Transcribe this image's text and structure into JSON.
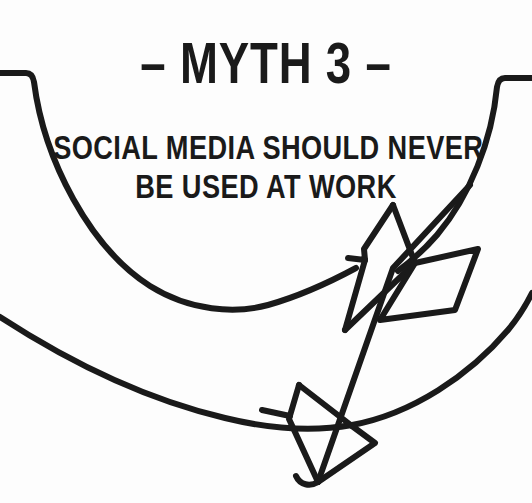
{
  "canvas": {
    "width": 532,
    "height": 503,
    "background_color": "#fdfdfd",
    "ink_color": "#1a1a1a"
  },
  "heading": {
    "title": "– MYTH 3 –",
    "title_plain": "MYTH 3",
    "dash_glyph": "–"
  },
  "subtitle": {
    "line1": "SOCIAL MEDIA SHOULD NEVER",
    "line2": "BE USED AT WORK",
    "full_text": "SOCIAL MEDIA SHOULD NEVER BE USED AT WORK"
  },
  "illustration": {
    "name": "arrow-with-swoosh-curves",
    "description": "A hand-drawn style arrow with diamond fletching pointing down-left, crossed by two sweeping curved lines",
    "stroke_color": "#1a1a1a",
    "stroke_width": 6,
    "parts": [
      {
        "name": "upper-curve",
        "label": "upper swoosh curve"
      },
      {
        "name": "lower-curve",
        "label": "lower swoosh curve"
      },
      {
        "name": "arrow-fletching-left",
        "label": "left diamond fletching"
      },
      {
        "name": "arrow-fletching-right",
        "label": "right diamond fletching"
      },
      {
        "name": "arrow-shaft",
        "label": "arrow shaft"
      },
      {
        "name": "arrow-head",
        "label": "double barbed arrowhead"
      }
    ]
  }
}
